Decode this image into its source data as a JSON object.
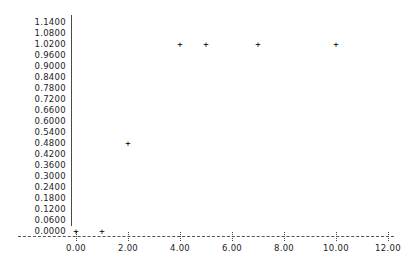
{
  "chart_data": {
    "type": "scatter",
    "title": "",
    "xlabel": "",
    "ylabel": "",
    "grid": false,
    "legend": false,
    "xlim": [
      0.0,
      12.0
    ],
    "ylim": [
      0.0,
      1.14
    ],
    "x": [
      0.0,
      1.0,
      2.0,
      4.0,
      5.0,
      7.0,
      10.0
    ],
    "y": [
      0.0,
      0.0,
      0.48,
      1.02,
      1.02,
      1.02,
      1.02
    ],
    "points": [
      {
        "x": 0.0,
        "y": 0.0
      },
      {
        "x": 1.0,
        "y": 0.0
      },
      {
        "x": 2.0,
        "y": 0.48
      },
      {
        "x": 4.0,
        "y": 1.02
      },
      {
        "x": 5.0,
        "y": 1.02
      },
      {
        "x": 7.0,
        "y": 1.02
      },
      {
        "x": 10.0,
        "y": 1.02
      }
    ],
    "marker": "plus",
    "xticks": [
      0.0,
      2.0,
      4.0,
      6.0,
      8.0,
      10.0,
      12.0
    ],
    "xtick_labels": [
      "0.00",
      "2.00",
      "4.00",
      "6.00",
      "8.00",
      "10.00",
      "12.00"
    ],
    "yticks": [
      1.14,
      1.08,
      1.02,
      0.96,
      0.9,
      0.84,
      0.78,
      0.72,
      0.66,
      0.6,
      0.54,
      0.48,
      0.42,
      0.36,
      0.3,
      0.24,
      0.18,
      0.12,
      0.06,
      0.0
    ],
    "ytick_labels": [
      "1.1400",
      "1.0800",
      "1.0200",
      "0.9600",
      "0.9000",
      "0.8400",
      "0.7800",
      "0.7200",
      "0.6600",
      "0.6000",
      "0.5400",
      "0.4800",
      "0.4200",
      "0.3600",
      "0.3000",
      "0.2400",
      "0.1800",
      "0.1200",
      "0.0600",
      "0.0000"
    ],
    "colors": {
      "marker": "#000000",
      "axis": "#4a4a4a",
      "text": "#1d1d1d",
      "background": "#ffffff"
    }
  }
}
